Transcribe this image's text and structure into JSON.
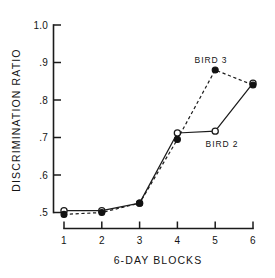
{
  "chart_data": {
    "type": "line",
    "title": "",
    "xlabel": "6-DAY BLOCKS",
    "ylabel": "DISCRIMINATION RATIO",
    "x": [
      1,
      2,
      3,
      4,
      5,
      6
    ],
    "xticklabels": [
      "1",
      "2",
      "3",
      "4",
      "5",
      "6"
    ],
    "yticks": [
      0.5,
      0.6,
      0.7,
      0.8,
      0.9,
      1.0
    ],
    "yticklabels": [
      ".5",
      ".6",
      ".7",
      ".8",
      ".9",
      "1.0"
    ],
    "xlim": [
      0.72,
      6.28
    ],
    "ylim": [
      0.47,
      1.0
    ],
    "grid": false,
    "legend_position": "inline-annotations",
    "series": [
      {
        "name": "BIRD 2",
        "marker": "open-circle",
        "linestyle": "solid",
        "color": "#1b1b1b",
        "values": [
          0.505,
          0.505,
          0.525,
          0.712,
          0.717,
          0.845
        ]
      },
      {
        "name": "BIRD 3",
        "marker": "filled-circle",
        "linestyle": "dashed",
        "color": "#121212",
        "values": [
          0.495,
          0.5,
          0.525,
          0.695,
          0.88,
          0.84
        ]
      }
    ],
    "annotations": [
      {
        "text": "BIRD 3",
        "x": 5.0,
        "y": 0.925
      },
      {
        "text": "BIRD 2",
        "x": 5.25,
        "y": 0.687
      }
    ]
  },
  "axis": {
    "y_tick_0": ".5",
    "y_tick_1": ".6",
    "y_tick_2": ".7",
    "y_tick_3": ".8",
    "y_tick_4": ".9",
    "y_tick_5": "1.0",
    "x_tick_0": "1",
    "x_tick_1": "2",
    "x_tick_2": "3",
    "x_tick_3": "4",
    "x_tick_4": "5",
    "x_tick_5": "6",
    "y_title": "DISCRIMINATION RATIO",
    "x_title": "6-DAY BLOCKS"
  },
  "labels": {
    "bird3": "BIRD 3",
    "bird2": "BIRD 2"
  }
}
